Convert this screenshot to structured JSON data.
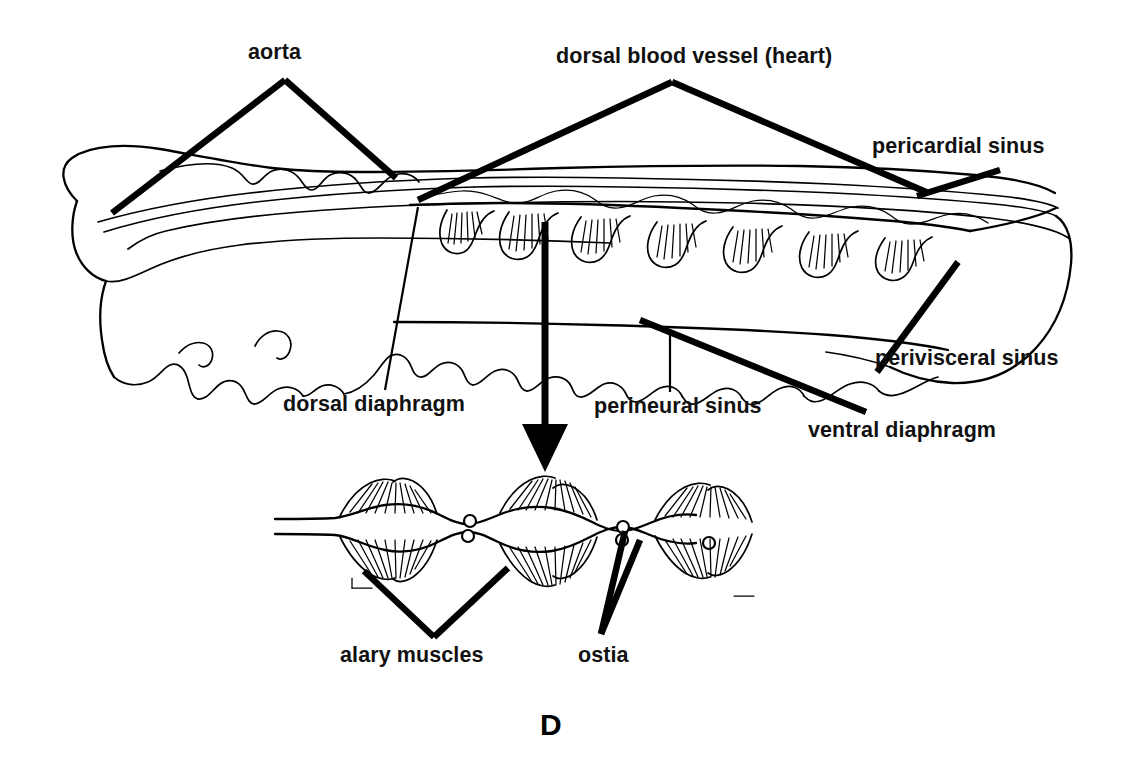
{
  "figure": {
    "panel_letter": "D"
  },
  "labels": {
    "aorta": "aorta",
    "dorsal_blood_vessel": "dorsal blood vessel (heart)",
    "pericardial_sinus": "pericardial sinus",
    "dorsal_diaphragm": "dorsal diaphragm",
    "perineural_sinus": "perineural sinus",
    "perivisceral_sinus": "perivisceral sinus",
    "ventral_diaphragm": "ventral diaphragm",
    "alary_muscles": "alary muscles",
    "ostia": "ostia"
  },
  "colors": {
    "ink": "#000000",
    "background": "#ffffff"
  },
  "icons": {
    "zoom_arrow": "down-arrow-icon"
  }
}
